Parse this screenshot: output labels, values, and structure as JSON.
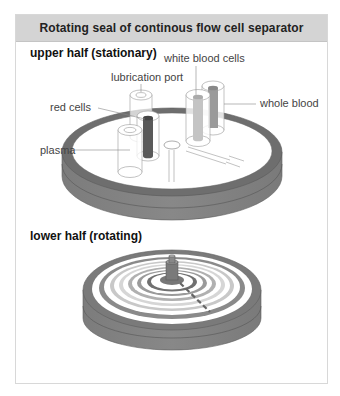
{
  "header": {
    "title": "Rotating seal of continous flow cell separator"
  },
  "upper": {
    "title": "upper half (stationary)",
    "labels": {
      "lubrication_port": "lubrication port",
      "white_blood_cells": "white blood cells",
      "red_cells": "red cells",
      "whole_blood": "whole blood",
      "plasma": "plasma"
    }
  },
  "lower": {
    "title": "lower half (rotating)"
  },
  "colors": {
    "header_bg": "#d4d4d4",
    "disc_side": "#7a7a7a",
    "disc_rim": "#6e6e6e",
    "red_cells_tube": "#5a5a5a",
    "white_cells_tube": "#b8b8b8",
    "whole_blood_tube": "#9a9a9a"
  }
}
